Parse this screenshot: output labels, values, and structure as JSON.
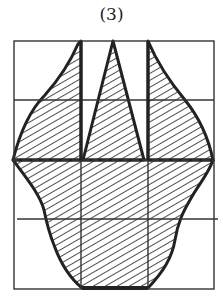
{
  "figure": {
    "label": "(3)",
    "grid": {
      "columns": 3,
      "rows": 4,
      "frame": {
        "x": 14,
        "y": 41,
        "width": 200,
        "height": 248
      },
      "vertical_lines_x": [
        81,
        148
      ],
      "horizontal_lines_y": [
        100,
        160,
        219
      ],
      "dashed_line_y": 160
    },
    "shapes": [
      {
        "name": "left-lobe",
        "description": "curved shape from top of left divider, widening to left tip at middle"
      },
      {
        "name": "center-triangle",
        "description": "triangle with apex at top center"
      },
      {
        "name": "right-lobe",
        "description": "curved shape from top of right divider, widening to right tip at middle"
      },
      {
        "name": "lower-body",
        "description": "rounded lower part narrowing to flat bottom base"
      }
    ],
    "hatch": "diagonal",
    "colors": {
      "stroke": "#222222",
      "background": "#ffffff"
    }
  }
}
